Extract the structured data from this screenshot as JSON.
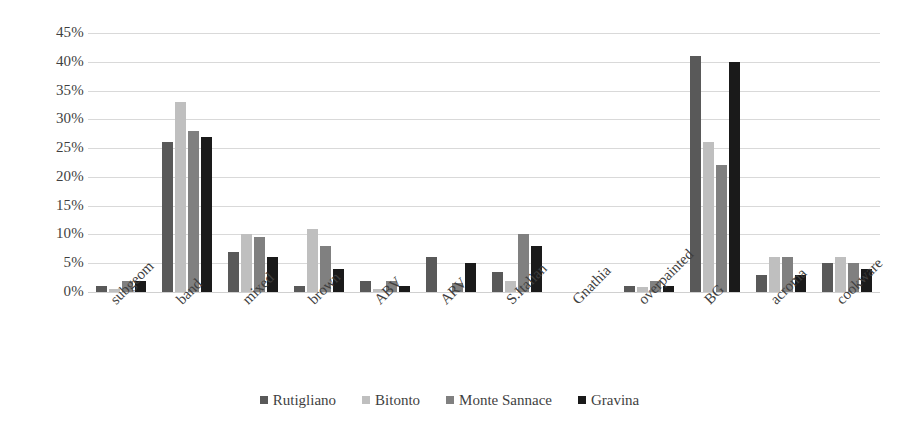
{
  "chart_data": {
    "type": "bar",
    "title": "",
    "subtitle": "",
    "xlabel": "",
    "ylabel": "",
    "ylim": [
      0,
      45
    ],
    "ytick_labels": [
      "0%",
      "5%",
      "10%",
      "15%",
      "20%",
      "25%",
      "30%",
      "35%",
      "40%",
      "45%"
    ],
    "ytick_values": [
      0,
      5,
      10,
      15,
      20,
      25,
      30,
      35,
      40,
      45
    ],
    "grid": true,
    "legend_position": "bottom",
    "categories": [
      "subgeom",
      "band",
      "mixed",
      "brown",
      "ABV",
      "ARV",
      "S.Italian",
      "Gnathia",
      "overpainted",
      "BG",
      "acroma",
      "cookware"
    ],
    "series": [
      {
        "name": "Rutigliano",
        "color": "#595959",
        "values": [
          1,
          26,
          7,
          1,
          2,
          6,
          3.5,
          0,
          1,
          41,
          3,
          5
        ]
      },
      {
        "name": "Bitonto",
        "color": "#bfbfbf",
        "values": [
          0.5,
          33,
          10,
          11,
          0.5,
          0,
          2,
          0,
          0.8,
          26,
          6,
          6
        ]
      },
      {
        "name": "Monte Sannace",
        "color": "#808080",
        "values": [
          2,
          28,
          9.5,
          8,
          2,
          1.5,
          10,
          0,
          2,
          22,
          6,
          5
        ]
      },
      {
        "name": "Gravina",
        "color": "#1a1a1a",
        "values": [
          2,
          27,
          6,
          4,
          1,
          5,
          8,
          0,
          1,
          40,
          3,
          4
        ]
      }
    ]
  }
}
